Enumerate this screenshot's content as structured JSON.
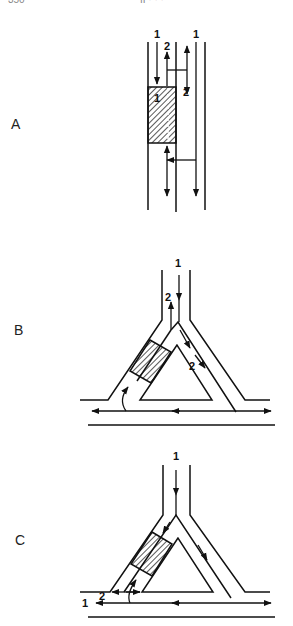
{
  "header": {
    "page_number": "350",
    "running_title": "II  ·  ·  ·"
  },
  "panels": [
    {
      "id": "A",
      "label": "A",
      "flow_labels": [
        "1",
        "2",
        "1",
        "2",
        "1"
      ]
    },
    {
      "id": "B",
      "label": "B",
      "flow_labels": [
        "1",
        "2",
        "2"
      ]
    },
    {
      "id": "C",
      "label": "C",
      "flow_labels": [
        "1",
        "1",
        "2"
      ]
    }
  ],
  "colors": {
    "ink": "#111111",
    "background": "#ffffff"
  }
}
